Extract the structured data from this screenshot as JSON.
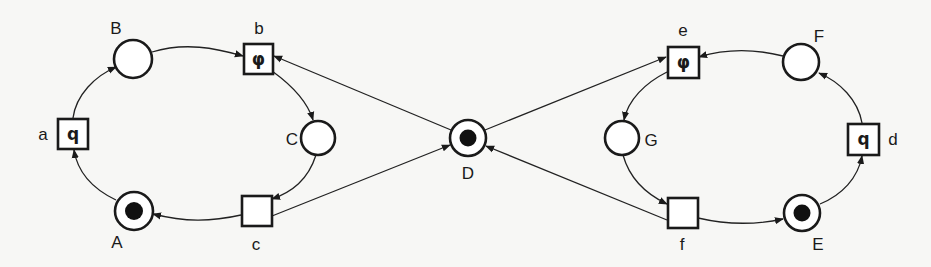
{
  "diagram": {
    "type": "petri-net",
    "colors": {
      "stroke": "#1a1a1a",
      "background": "#f7f7f5",
      "token": "#111111"
    },
    "places": [
      {
        "id": "A",
        "label": "A",
        "tokens": 1
      },
      {
        "id": "B",
        "label": "B",
        "tokens": 0
      },
      {
        "id": "C",
        "label": "C",
        "tokens": 0
      },
      {
        "id": "D",
        "label": "D",
        "tokens": 1
      },
      {
        "id": "E",
        "label": "E",
        "tokens": 1
      },
      {
        "id": "F",
        "label": "F",
        "tokens": 0
      },
      {
        "id": "G",
        "label": "G",
        "tokens": 0
      }
    ],
    "transitions": [
      {
        "id": "a",
        "label": "a",
        "inscription": "q"
      },
      {
        "id": "b",
        "label": "b",
        "inscription": "φ"
      },
      {
        "id": "c",
        "label": "c",
        "inscription": ""
      },
      {
        "id": "d",
        "label": "d",
        "inscription": "q"
      },
      {
        "id": "e",
        "label": "e",
        "inscription": "φ"
      },
      {
        "id": "f",
        "label": "f",
        "inscription": ""
      }
    ],
    "arcs": [
      {
        "from": "A",
        "to": "a"
      },
      {
        "from": "a",
        "to": "B"
      },
      {
        "from": "B",
        "to": "b"
      },
      {
        "from": "b",
        "to": "C"
      },
      {
        "from": "C",
        "to": "c"
      },
      {
        "from": "c",
        "to": "A"
      },
      {
        "from": "D",
        "to": "b"
      },
      {
        "from": "c",
        "to": "D"
      },
      {
        "from": "E",
        "to": "d"
      },
      {
        "from": "d",
        "to": "F"
      },
      {
        "from": "F",
        "to": "e"
      },
      {
        "from": "e",
        "to": "G"
      },
      {
        "from": "G",
        "to": "f"
      },
      {
        "from": "f",
        "to": "E"
      },
      {
        "from": "D",
        "to": "e"
      },
      {
        "from": "f",
        "to": "D"
      }
    ]
  }
}
